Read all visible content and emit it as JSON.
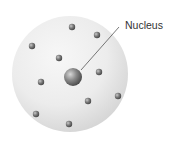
{
  "diagram": {
    "label": "Nucleus",
    "sphere": {
      "cx": 70,
      "cy": 74,
      "r": 58
    },
    "nucleus": {
      "cx": 73,
      "cy": 77,
      "r": 9
    },
    "leader_line": {
      "x1": 81,
      "y1": 70,
      "x2": 119,
      "y2": 27
    },
    "electrons": [
      {
        "cx": 72,
        "cy": 27
      },
      {
        "cx": 97,
        "cy": 35
      },
      {
        "cx": 32,
        "cy": 46
      },
      {
        "cx": 59,
        "cy": 58
      },
      {
        "cx": 99,
        "cy": 72
      },
      {
        "cx": 41,
        "cy": 82
      },
      {
        "cx": 88,
        "cy": 101
      },
      {
        "cx": 118,
        "cy": 96
      },
      {
        "cx": 36,
        "cy": 114
      },
      {
        "cx": 69,
        "cy": 124
      }
    ],
    "colors": {
      "sphere_light": "#f4f4f4",
      "sphere_dark": "#d6d6d6",
      "particle_dark": "#555555",
      "particle_light": "#bcbcbc",
      "line": "#555555"
    }
  }
}
